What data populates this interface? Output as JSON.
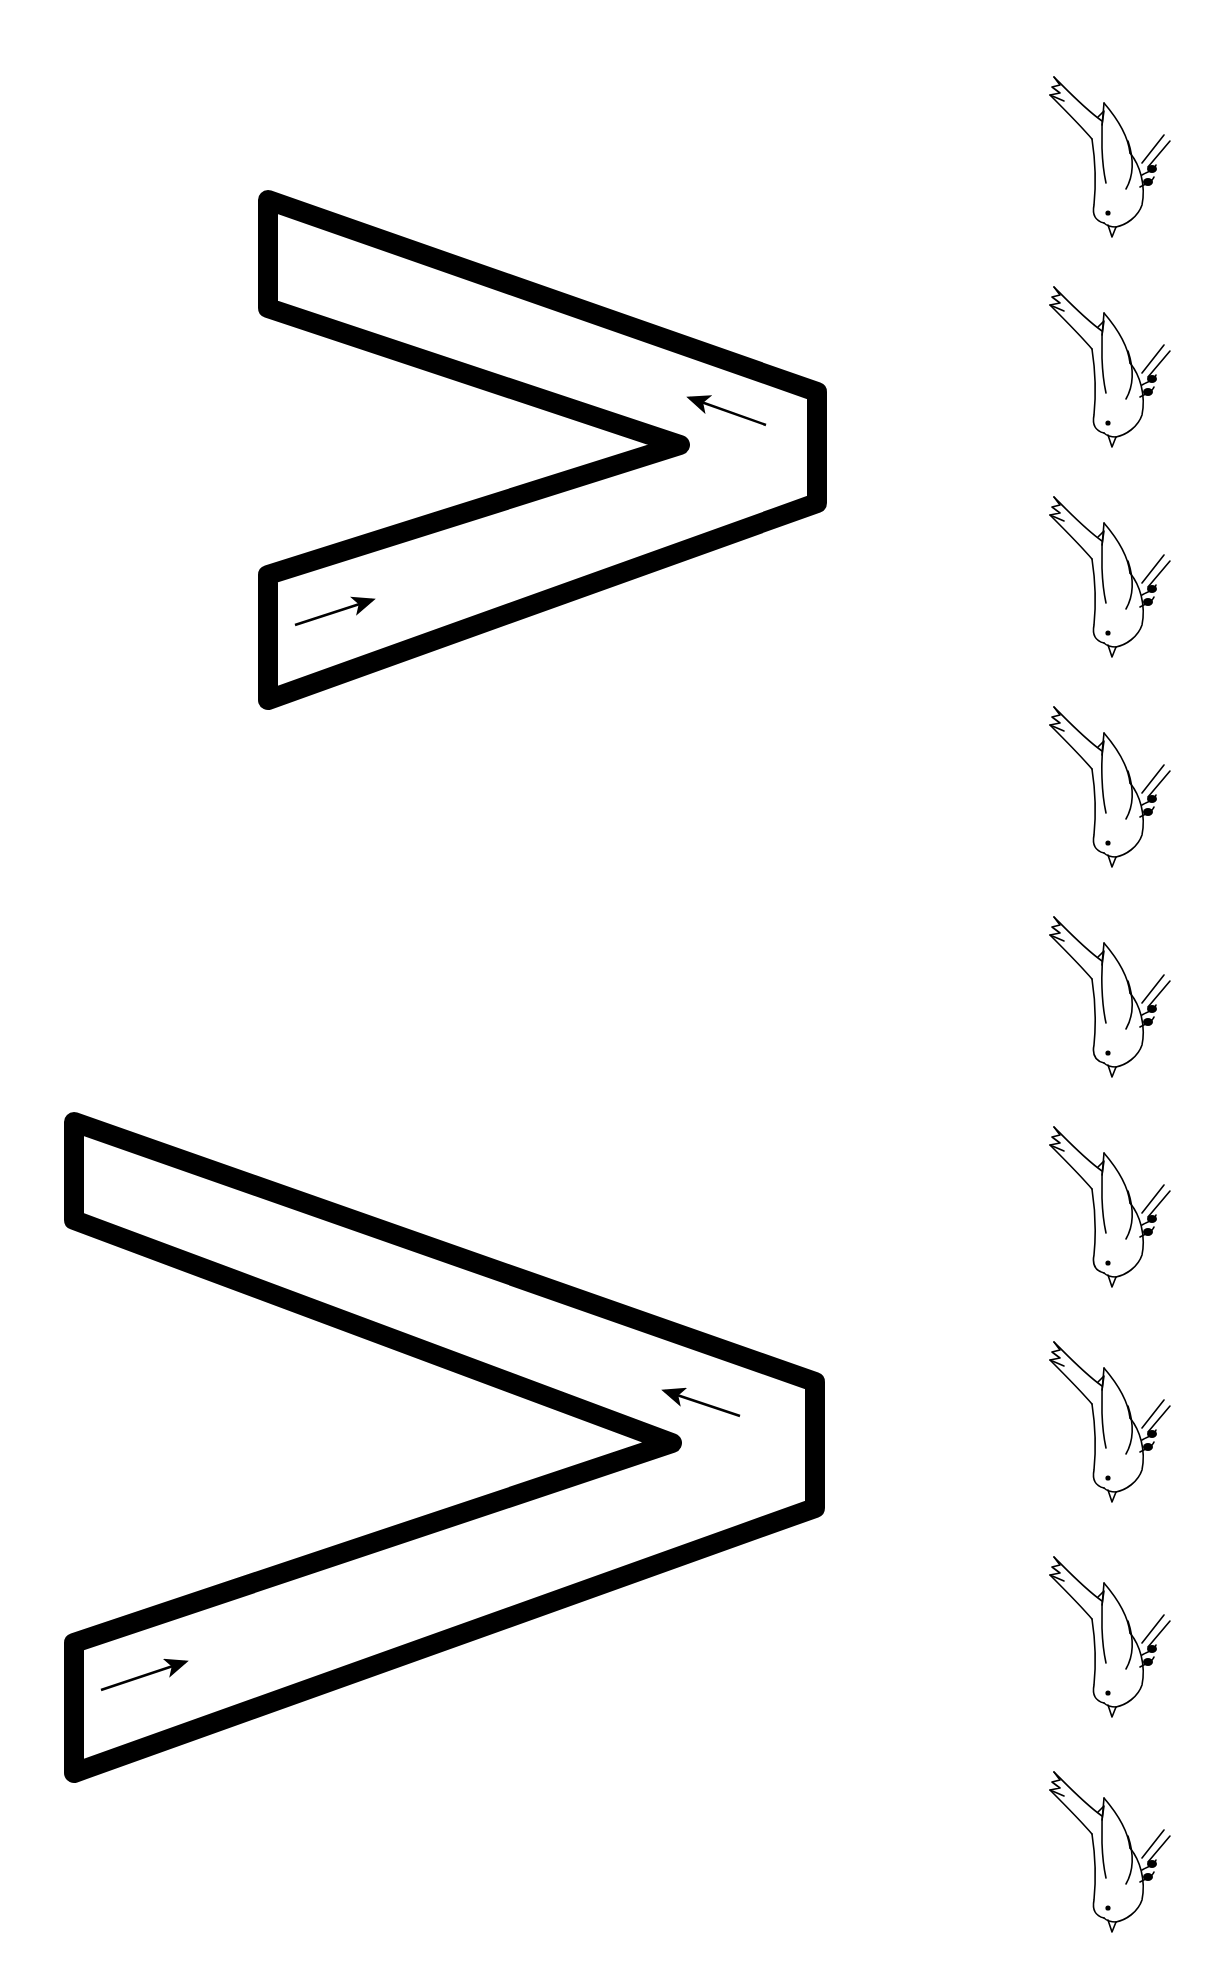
{
  "worksheet": {
    "type": "letter-tracing",
    "letter": "v",
    "orientation": "rotated 90 degrees clockwise",
    "ink_color": "#000000",
    "paper_color": "#ffffff"
  },
  "letters": [
    {
      "name": "small-v",
      "outer_polygon": [
        [
          258,
          188
        ],
        [
          827,
          385
        ],
        [
          827,
          510
        ],
        [
          258,
          712
        ],
        [
          258,
          565
        ],
        [
          665,
          445
        ],
        [
          258,
          318
        ]
      ],
      "stroke_width": 20,
      "arrows": [
        {
          "from": [
            295,
            625
          ],
          "to": [
            372,
            600
          ],
          "meaning": "start-stroke-direction"
        },
        {
          "from": [
            766,
            425
          ],
          "to": [
            690,
            398
          ],
          "meaning": "return-stroke-direction"
        }
      ]
    },
    {
      "name": "large-v",
      "outer_polygon": [
        [
          64,
          1110
        ],
        [
          825,
          1375
        ],
        [
          825,
          1515
        ],
        [
          64,
          1785
        ],
        [
          64,
          1633
        ],
        [
          662,
          1443
        ],
        [
          64,
          1230
        ]
      ],
      "stroke_width": 20,
      "arrows": [
        {
          "from": [
            101,
            1690
          ],
          "to": [
            185,
            1662
          ],
          "meaning": "start-stroke-direction"
        },
        {
          "from": [
            740,
            1416
          ],
          "to": [
            665,
            1391
          ],
          "meaning": "return-stroke-direction"
        }
      ]
    }
  ],
  "birds": {
    "icon": "bird-icon",
    "count": 9,
    "tops": [
      55,
      265,
      475,
      685,
      895,
      1105,
      1320,
      1535,
      1750
    ]
  },
  "labels": {
    "description": "Letter v tracing worksheet with direction arrows and a column of bird illustrations"
  }
}
